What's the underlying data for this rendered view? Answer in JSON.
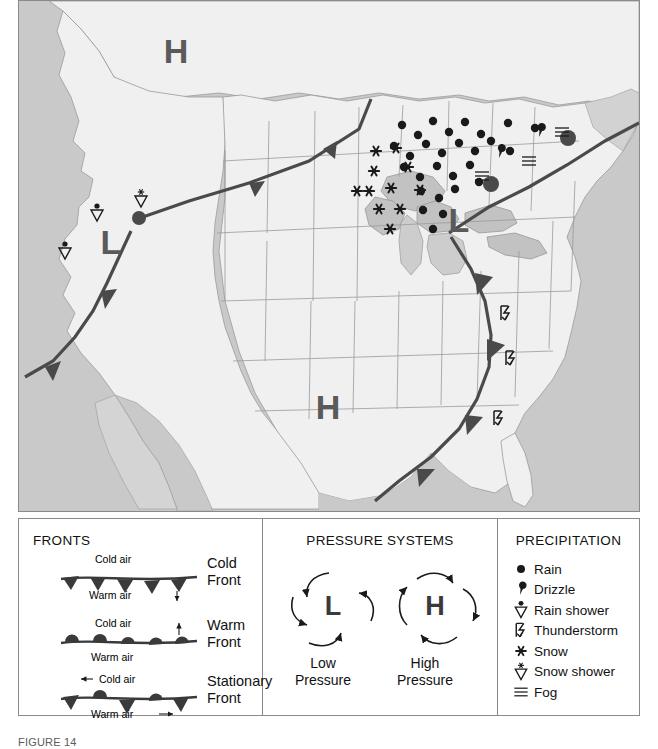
{
  "figure": {
    "caption": "FIGURE 14",
    "colors": {
      "land": "#f0f0f0",
      "water": "#c9c9c9",
      "lake": "#c2c2c2",
      "border": "#8a8a8a",
      "state_line": "#9a9a9a",
      "front_line": "#4a4a4a",
      "symbol": "#1a1a1a"
    }
  },
  "map": {
    "pressure_centers": [
      {
        "type": "H",
        "label": "H",
        "name": "high-northwest",
        "x": 157,
        "y": 62
      },
      {
        "type": "L",
        "label": "L",
        "name": "low-great-basin",
        "x": 92,
        "y": 253
      },
      {
        "type": "L",
        "label": "L",
        "name": "low-great-lakes",
        "x": 440,
        "y": 231
      },
      {
        "type": "H",
        "label": "H",
        "name": "high-south-central",
        "x": 309,
        "y": 418
      }
    ],
    "fronts": [
      {
        "name": "warm-front-northern-plains",
        "kind": "warm",
        "label": "Warm Front"
      },
      {
        "name": "cold-front-west",
        "kind": "cold",
        "label": "Cold Front"
      },
      {
        "name": "warm-front-northeast",
        "kind": "warm",
        "label": "Warm Front"
      },
      {
        "name": "cold-front-east",
        "kind": "cold",
        "label": "Cold Front"
      }
    ],
    "precipitation_symbols": {
      "rain": [
        {
          "x": 383,
          "y": 124
        },
        {
          "x": 399,
          "y": 134
        },
        {
          "x": 414,
          "y": 120
        },
        {
          "x": 430,
          "y": 131
        },
        {
          "x": 446,
          "y": 121
        },
        {
          "x": 462,
          "y": 133
        },
        {
          "x": 489,
          "y": 122
        },
        {
          "x": 516,
          "y": 127
        },
        {
          "x": 375,
          "y": 145
        },
        {
          "x": 391,
          "y": 155
        },
        {
          "x": 407,
          "y": 143
        },
        {
          "x": 423,
          "y": 152
        },
        {
          "x": 440,
          "y": 142
        },
        {
          "x": 456,
          "y": 150
        },
        {
          "x": 472,
          "y": 140
        },
        {
          "x": 491,
          "y": 150
        },
        {
          "x": 385,
          "y": 166
        },
        {
          "x": 401,
          "y": 176
        },
        {
          "x": 418,
          "y": 165
        },
        {
          "x": 434,
          "y": 175
        },
        {
          "x": 451,
          "y": 164
        },
        {
          "x": 460,
          "y": 181
        },
        {
          "x": 402,
          "y": 190
        },
        {
          "x": 420,
          "y": 197
        },
        {
          "x": 436,
          "y": 188
        },
        {
          "x": 404,
          "y": 209
        },
        {
          "x": 424,
          "y": 213
        },
        {
          "x": 414,
          "y": 228
        }
      ],
      "snow": [
        {
          "x": 357,
          "y": 150
        },
        {
          "x": 377,
          "y": 147
        },
        {
          "x": 389,
          "y": 166
        },
        {
          "x": 355,
          "y": 170
        },
        {
          "x": 338,
          "y": 190
        },
        {
          "x": 350,
          "y": 190
        },
        {
          "x": 372,
          "y": 187
        },
        {
          "x": 401,
          "y": 189
        },
        {
          "x": 360,
          "y": 208
        },
        {
          "x": 381,
          "y": 208
        },
        {
          "x": 371,
          "y": 228
        }
      ],
      "drizzle": [
        {
          "x": 481,
          "y": 152
        },
        {
          "x": 521,
          "y": 131
        }
      ],
      "fog": [
        {
          "x": 463,
          "y": 175
        },
        {
          "x": 510,
          "y": 160
        },
        {
          "x": 543,
          "y": 131
        }
      ],
      "rain_shower": [
        {
          "x": 46,
          "y": 250
        },
        {
          "x": 78,
          "y": 212
        }
      ],
      "snow_shower": [
        {
          "x": 122,
          "y": 198
        }
      ],
      "thunderstorm": [
        {
          "x": 487,
          "y": 313
        },
        {
          "x": 492,
          "y": 358
        },
        {
          "x": 480,
          "y": 418
        }
      ]
    }
  },
  "legend": {
    "fronts": {
      "title": "FRONTS",
      "rows": [
        {
          "name": "cold-front",
          "label_line1": "Cold",
          "label_line2": "Front",
          "above_text": "Cold air",
          "below_text": "Warm air",
          "arrow": "down"
        },
        {
          "name": "warm-front",
          "label_line1": "Warm",
          "label_line2": "Front",
          "above_text": "Cold air",
          "below_text": "Warm air",
          "arrow": "up"
        },
        {
          "name": "stationary-front",
          "label_line1": "Stationary",
          "label_line2": "Front",
          "above_text": "Cold air",
          "below_text": "Warm air",
          "arrow": "both"
        }
      ]
    },
    "pressure": {
      "title": "PRESSURE SYSTEMS",
      "low": {
        "symbol": "L",
        "caption_line1": "Low",
        "caption_line2": "Pressure",
        "rotation": "counterclockwise"
      },
      "high": {
        "symbol": "H",
        "caption_line1": "High",
        "caption_line2": "Pressure",
        "rotation": "clockwise"
      }
    },
    "precipitation": {
      "title": "PRECIPITATION",
      "items": [
        {
          "icon": "rain-dot-icon",
          "label": "Rain"
        },
        {
          "icon": "drizzle-comma-icon",
          "label": "Drizzle"
        },
        {
          "icon": "rain-shower-icon",
          "label": "Rain shower"
        },
        {
          "icon": "thunderstorm-icon",
          "label": "Thunderstorm"
        },
        {
          "icon": "snow-asterisk-icon",
          "label": "Snow"
        },
        {
          "icon": "snow-shower-icon",
          "label": "Snow shower"
        },
        {
          "icon": "fog-lines-icon",
          "label": "Fog"
        }
      ]
    }
  }
}
